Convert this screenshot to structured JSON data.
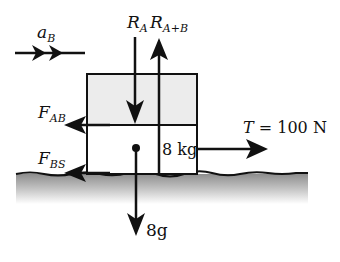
{
  "diagram": {
    "type": "free-body-diagram",
    "acceleration": {
      "symbol": "a",
      "subscript": "B"
    },
    "forces": {
      "reaction_a": {
        "symbol": "R",
        "subscript": "A",
        "direction": "down"
      },
      "reaction_ab": {
        "symbol": "R",
        "subscript": "A+B",
        "direction": "up"
      },
      "friction_ab": {
        "symbol": "F",
        "subscript": "AB",
        "direction": "left"
      },
      "friction_bs": {
        "symbol": "F",
        "subscript": "BS",
        "direction": "left"
      },
      "tension": {
        "symbol": "T",
        "equals": " = 100 N",
        "direction": "right"
      },
      "weight": {
        "label": "8g",
        "direction": "down"
      }
    },
    "mass_label": "8 kg",
    "colors": {
      "ink": "#111111",
      "upper_block": "#ececec",
      "lower_block": "#ffffff",
      "ground": "#9a9a9a"
    }
  }
}
